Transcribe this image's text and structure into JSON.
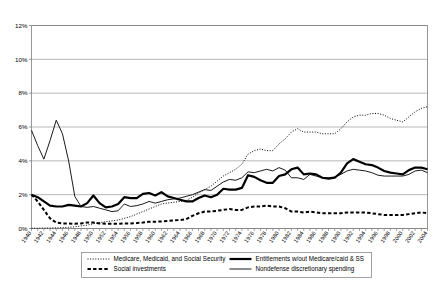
{
  "chart_data": {
    "type": "line",
    "title": "",
    "xlabel": "",
    "ylabel": "",
    "ylim": [
      0,
      12
    ],
    "yticks": [
      "0%",
      "2%",
      "4%",
      "6%",
      "8%",
      "10%",
      "12%"
    ],
    "ytick_values": [
      0,
      2,
      4,
      6,
      8,
      10,
      12
    ],
    "grid": true,
    "legend_position": "bottom",
    "xlim": [
      1940,
      2004
    ],
    "x": [
      1940,
      1941,
      1942,
      1943,
      1944,
      1945,
      1946,
      1947,
      1948,
      1949,
      1950,
      1951,
      1952,
      1953,
      1954,
      1955,
      1956,
      1957,
      1958,
      1959,
      1960,
      1961,
      1962,
      1963,
      1964,
      1965,
      1966,
      1967,
      1968,
      1969,
      1970,
      1971,
      1972,
      1973,
      1974,
      1975,
      1976,
      1977,
      1978,
      1979,
      1980,
      1981,
      1982,
      1983,
      1984,
      1985,
      1986,
      1987,
      1988,
      1989,
      1990,
      1991,
      1992,
      1993,
      1994,
      1995,
      1996,
      1997,
      1998,
      1999,
      2000,
      2001,
      2002,
      2003,
      2004
    ],
    "xticklabels": [
      "1940",
      "1942",
      "1944",
      "1946",
      "1948",
      "1950",
      "1952",
      "1954",
      "1956",
      "1958",
      "1960",
      "1962",
      "1964",
      "1966",
      "1968",
      "1970",
      "1972",
      "1974",
      "1976",
      "1978",
      "1980",
      "1982",
      "1984",
      "1986",
      "1988",
      "1990",
      "1992",
      "1994",
      "1996",
      "1998",
      "2000",
      "2002",
      "2004"
    ],
    "xtick_step": 2,
    "series": [
      {
        "name": "Medicare, Medicaid, and Social Security",
        "style": "dotted",
        "width": 1.0,
        "color": "#000000",
        "values": [
          0.02,
          0.02,
          0.03,
          0.03,
          0.04,
          0.05,
          0.07,
          0.1,
          0.15,
          0.2,
          0.28,
          0.35,
          0.4,
          0.45,
          0.5,
          0.6,
          0.7,
          0.85,
          1.0,
          1.15,
          1.3,
          1.45,
          1.5,
          1.55,
          1.6,
          1.65,
          1.85,
          2.1,
          2.3,
          2.5,
          2.8,
          3.1,
          3.3,
          3.5,
          3.8,
          4.4,
          4.6,
          4.7,
          4.6,
          4.6,
          5.0,
          5.3,
          5.7,
          5.9,
          5.7,
          5.7,
          5.7,
          5.6,
          5.6,
          5.6,
          5.9,
          6.3,
          6.6,
          6.7,
          6.7,
          6.8,
          6.8,
          6.7,
          6.5,
          6.4,
          6.3,
          6.6,
          6.9,
          7.1,
          7.2
        ]
      },
      {
        "name": "Social investments",
        "style": "dashed",
        "width": 2.0,
        "color": "#000000",
        "values": [
          2.0,
          1.6,
          1.1,
          0.6,
          0.35,
          0.3,
          0.3,
          0.28,
          0.3,
          0.35,
          0.35,
          0.3,
          0.28,
          0.28,
          0.28,
          0.3,
          0.3,
          0.32,
          0.35,
          0.4,
          0.4,
          0.42,
          0.45,
          0.48,
          0.5,
          0.55,
          0.75,
          0.9,
          1.0,
          1.0,
          1.05,
          1.1,
          1.15,
          1.1,
          1.1,
          1.25,
          1.3,
          1.3,
          1.35,
          1.3,
          1.3,
          1.2,
          1.0,
          1.0,
          0.95,
          1.0,
          0.95,
          0.9,
          0.9,
          0.9,
          0.9,
          0.95,
          0.95,
          0.95,
          0.95,
          0.9,
          0.85,
          0.8,
          0.8,
          0.8,
          0.8,
          0.85,
          0.9,
          0.95,
          0.9
        ]
      },
      {
        "name": "Entitlements w/out Medicare/caid & SS",
        "style": "solid",
        "width": 2.2,
        "color": "#000000",
        "values": [
          2.0,
          1.85,
          1.6,
          1.35,
          1.3,
          1.3,
          1.4,
          1.35,
          1.3,
          1.5,
          1.95,
          1.5,
          1.25,
          1.3,
          1.45,
          1.85,
          1.8,
          1.8,
          2.05,
          2.1,
          1.95,
          2.15,
          1.9,
          1.8,
          1.7,
          1.6,
          1.6,
          1.8,
          1.95,
          1.85,
          2.0,
          2.35,
          2.3,
          2.3,
          2.4,
          3.15,
          3.05,
          2.85,
          2.7,
          2.7,
          3.1,
          3.2,
          3.5,
          3.6,
          3.2,
          3.25,
          3.2,
          3.0,
          2.95,
          3.0,
          3.3,
          3.85,
          4.1,
          3.95,
          3.8,
          3.75,
          3.6,
          3.4,
          3.3,
          3.25,
          3.2,
          3.45,
          3.6,
          3.6,
          3.5
        ]
      },
      {
        "name": "Nondefense discretionary spending",
        "style": "solid",
        "width": 0.9,
        "color": "#000000",
        "values": [
          5.8,
          4.9,
          4.1,
          5.2,
          6.4,
          5.6,
          4.0,
          1.9,
          1.3,
          1.25,
          1.3,
          1.2,
          1.1,
          1.0,
          1.05,
          1.45,
          1.3,
          1.35,
          1.45,
          1.6,
          1.5,
          1.6,
          1.7,
          1.75,
          1.8,
          1.9,
          2.0,
          2.15,
          2.3,
          2.25,
          2.5,
          2.75,
          2.9,
          2.85,
          3.0,
          3.35,
          3.3,
          3.4,
          3.5,
          3.4,
          3.6,
          3.45,
          3.0,
          3.0,
          2.9,
          3.2,
          3.1,
          3.0,
          3.0,
          3.05,
          3.2,
          3.4,
          3.5,
          3.45,
          3.4,
          3.3,
          3.15,
          3.1,
          3.1,
          3.1,
          3.1,
          3.2,
          3.4,
          3.45,
          3.3
        ]
      }
    ]
  },
  "legend": {
    "items": [
      {
        "label": "Medicare, Medicaid, and Social Security",
        "style": "dotted"
      },
      {
        "label": "Entitlements w/out Medicare/caid & SS",
        "style": "solid-thick"
      },
      {
        "label": "Social investments",
        "style": "dashed"
      },
      {
        "label": "Nondefense discretionary spending",
        "style": "solid-thin"
      }
    ]
  }
}
